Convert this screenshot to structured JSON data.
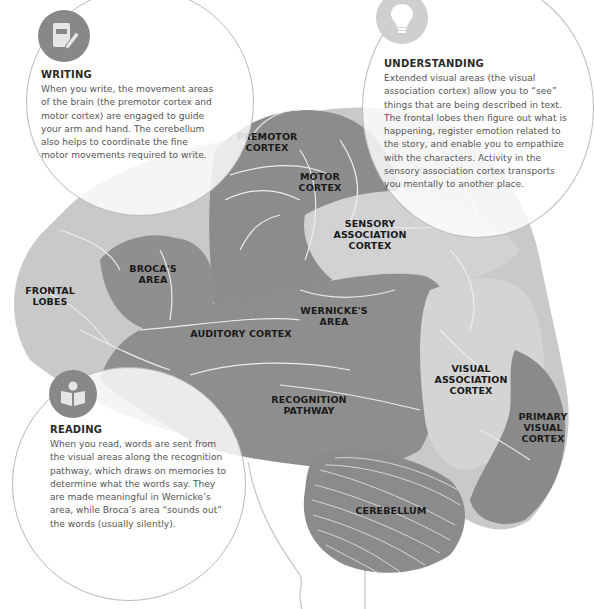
{
  "colors": {
    "background": "#ffffff",
    "brain_light": "#c9c9c9",
    "brain_mid": "#b3b3b3",
    "brain_dark": "#8e8e8e",
    "brain_darker": "#878787",
    "sulci": "#e6e6e6",
    "label_text": "#1a1a1a",
    "bubble_border": "#b9b9b9",
    "body_text": "#555555",
    "icon_dark": "#888888",
    "icon_light": "#cfcfcf"
  },
  "regions": {
    "premotor_cortex": [
      "PREMOTOR",
      "CORTEX"
    ],
    "motor_cortex": [
      "MOTOR",
      "CORTEX"
    ],
    "sensory_association_cortex": [
      "SENSORY",
      "ASSOCIATION",
      "CORTEX"
    ],
    "brocas_area": [
      "BROCA'S",
      "AREA"
    ],
    "frontal_lobes": [
      "FRONTAL",
      "LOBES"
    ],
    "wernickes_area": [
      "WERNICKE'S",
      "AREA"
    ],
    "auditory_cortex": [
      "AUDITORY CORTEX"
    ],
    "recognition_pathway": [
      "RECOGNITION",
      "PATHWAY"
    ],
    "visual_association_cortex": [
      "VISUAL",
      "ASSOCIATION",
      "CORTEX"
    ],
    "primary_visual_cortex": [
      "PRIMARY",
      "VISUAL",
      "CORTEX"
    ],
    "cerebellum": [
      "CEREBELLUM"
    ]
  },
  "panels": {
    "writing": {
      "icon": "notebook-pencil-icon",
      "title": "WRITING",
      "lines": [
        "When you write, the movement areas",
        "of the brain (the premotor cortex and",
        "motor cortex) are engaged to guide",
        "your arm and hand. The cerebellum",
        "also helps to coordinate the fine",
        "motor movements required to write."
      ]
    },
    "understanding": {
      "icon": "lightbulb-icon",
      "title": "UNDERSTANDING",
      "lines": [
        "Extended visual areas (the visual",
        "association cortex) allow you to “see”",
        "things that are being described in text.",
        "The frontal lobes then figure out what is",
        "happening, register emotion related to",
        "the story, and enable you to empathize",
        "with the characters. Activity in the",
        "sensory association cortex transports",
        "you mentally to another place."
      ]
    },
    "reading": {
      "icon": "person-reading-book-icon",
      "title": "READING",
      "lines": [
        "When you read, words are sent from",
        "the visual areas along the recognition",
        "pathway, which draws on memories to",
        "determine what the words say. They",
        "are made meaningful in Wernicke’s",
        "area, while Broca’s area “sounds out”",
        "the words (usually silently)."
      ]
    }
  }
}
